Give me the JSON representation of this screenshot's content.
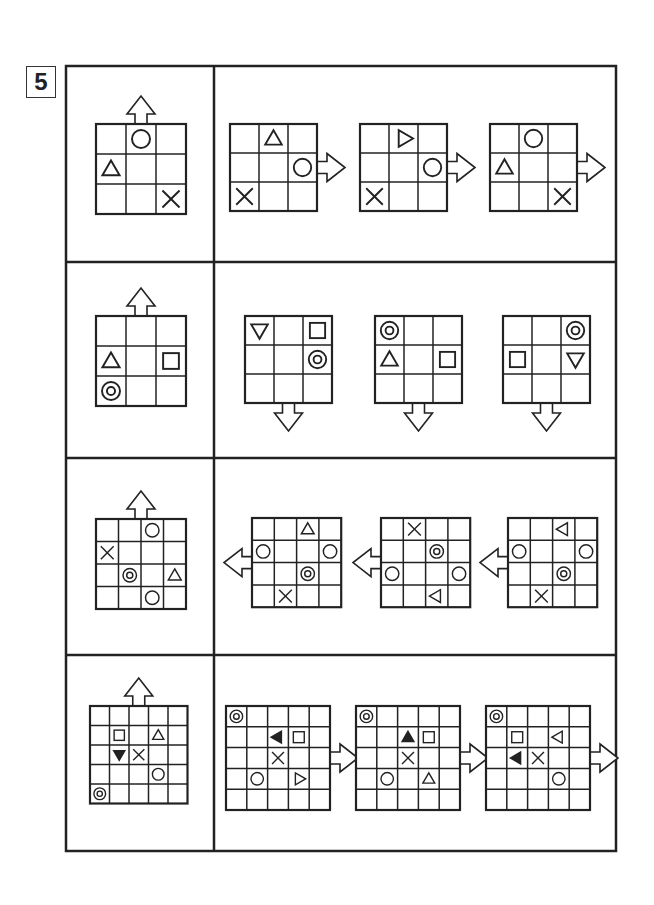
{
  "puzzle": {
    "number": "5",
    "colors": {
      "stroke": "#222222",
      "background": "#ffffff"
    },
    "rows": [
      {
        "reference": {
          "size": 3,
          "arrow": "up",
          "cells": [
            {
              "r": 0,
              "c": 1,
              "shape": "circle"
            },
            {
              "r": 1,
              "c": 0,
              "shape": "triangle-up"
            },
            {
              "r": 2,
              "c": 2,
              "shape": "cross"
            }
          ]
        },
        "options": [
          {
            "arrow": "right",
            "cells": [
              {
                "r": 0,
                "c": 1,
                "shape": "triangle-up"
              },
              {
                "r": 1,
                "c": 2,
                "shape": "circle"
              },
              {
                "r": 2,
                "c": 0,
                "shape": "cross"
              }
            ]
          },
          {
            "arrow": "right",
            "cells": [
              {
                "r": 0,
                "c": 1,
                "shape": "triangle-right"
              },
              {
                "r": 1,
                "c": 2,
                "shape": "circle"
              },
              {
                "r": 2,
                "c": 0,
                "shape": "cross"
              }
            ]
          },
          {
            "arrow": "right",
            "cells": [
              {
                "r": 0,
                "c": 1,
                "shape": "circle"
              },
              {
                "r": 1,
                "c": 0,
                "shape": "triangle-up"
              },
              {
                "r": 2,
                "c": 2,
                "shape": "cross"
              }
            ]
          }
        ]
      },
      {
        "reference": {
          "size": 3,
          "arrow": "up",
          "cells": [
            {
              "r": 1,
              "c": 0,
              "shape": "triangle-up"
            },
            {
              "r": 1,
              "c": 2,
              "shape": "square"
            },
            {
              "r": 2,
              "c": 0,
              "shape": "double-circle"
            }
          ]
        },
        "options": [
          {
            "arrow": "down",
            "cells": [
              {
                "r": 0,
                "c": 0,
                "shape": "triangle-down"
              },
              {
                "r": 0,
                "c": 2,
                "shape": "square"
              },
              {
                "r": 1,
                "c": 2,
                "shape": "double-circle"
              }
            ]
          },
          {
            "arrow": "down",
            "cells": [
              {
                "r": 0,
                "c": 0,
                "shape": "double-circle"
              },
              {
                "r": 1,
                "c": 0,
                "shape": "triangle-up"
              },
              {
                "r": 1,
                "c": 2,
                "shape": "square"
              }
            ]
          },
          {
            "arrow": "down",
            "cells": [
              {
                "r": 0,
                "c": 2,
                "shape": "double-circle"
              },
              {
                "r": 1,
                "c": 0,
                "shape": "square"
              },
              {
                "r": 1,
                "c": 2,
                "shape": "triangle-down"
              }
            ]
          }
        ]
      },
      {
        "reference": {
          "size": 4,
          "arrow": "up",
          "cells": [
            {
              "r": 0,
              "c": 2,
              "shape": "circle"
            },
            {
              "r": 1,
              "c": 0,
              "shape": "cross"
            },
            {
              "r": 2,
              "c": 1,
              "shape": "double-circle"
            },
            {
              "r": 2,
              "c": 3,
              "shape": "triangle-up"
            },
            {
              "r": 3,
              "c": 2,
              "shape": "circle"
            }
          ]
        },
        "options": [
          {
            "arrow": "left",
            "cells": [
              {
                "r": 0,
                "c": 2,
                "shape": "triangle-up"
              },
              {
                "r": 1,
                "c": 0,
                "shape": "circle"
              },
              {
                "r": 1,
                "c": 3,
                "shape": "circle"
              },
              {
                "r": 2,
                "c": 2,
                "shape": "double-circle"
              },
              {
                "r": 3,
                "c": 1,
                "shape": "cross"
              }
            ]
          },
          {
            "arrow": "left",
            "cells": [
              {
                "r": 0,
                "c": 1,
                "shape": "cross"
              },
              {
                "r": 1,
                "c": 2,
                "shape": "double-circle"
              },
              {
                "r": 2,
                "c": 0,
                "shape": "circle"
              },
              {
                "r": 2,
                "c": 3,
                "shape": "circle"
              },
              {
                "r": 3,
                "c": 2,
                "shape": "triangle-left"
              }
            ]
          },
          {
            "arrow": "left",
            "cells": [
              {
                "r": 0,
                "c": 2,
                "shape": "triangle-left"
              },
              {
                "r": 1,
                "c": 0,
                "shape": "circle"
              },
              {
                "r": 1,
                "c": 3,
                "shape": "circle"
              },
              {
                "r": 2,
                "c": 2,
                "shape": "double-circle"
              },
              {
                "r": 3,
                "c": 1,
                "shape": "cross"
              }
            ]
          }
        ]
      },
      {
        "reference": {
          "size": 5,
          "arrow": "up",
          "cells": [
            {
              "r": 1,
              "c": 1,
              "shape": "square"
            },
            {
              "r": 1,
              "c": 3,
              "shape": "triangle-up"
            },
            {
              "r": 2,
              "c": 1,
              "shape": "filled-triangle-down"
            },
            {
              "r": 2,
              "c": 2,
              "shape": "cross"
            },
            {
              "r": 3,
              "c": 3,
              "shape": "circle"
            },
            {
              "r": 4,
              "c": 0,
              "shape": "double-circle"
            }
          ]
        },
        "options": [
          {
            "arrow": "right",
            "cells": [
              {
                "r": 0,
                "c": 0,
                "shape": "double-circle"
              },
              {
                "r": 1,
                "c": 2,
                "shape": "filled-triangle-left"
              },
              {
                "r": 1,
                "c": 3,
                "shape": "square"
              },
              {
                "r": 2,
                "c": 2,
                "shape": "cross"
              },
              {
                "r": 3,
                "c": 1,
                "shape": "circle"
              },
              {
                "r": 3,
                "c": 3,
                "shape": "triangle-right"
              }
            ]
          },
          {
            "arrow": "right",
            "cells": [
              {
                "r": 0,
                "c": 0,
                "shape": "double-circle"
              },
              {
                "r": 1,
                "c": 2,
                "shape": "filled-triangle-up"
              },
              {
                "r": 1,
                "c": 3,
                "shape": "square"
              },
              {
                "r": 2,
                "c": 2,
                "shape": "cross"
              },
              {
                "r": 3,
                "c": 1,
                "shape": "circle"
              },
              {
                "r": 3,
                "c": 3,
                "shape": "triangle-up"
              }
            ]
          },
          {
            "arrow": "right",
            "cells": [
              {
                "r": 0,
                "c": 0,
                "shape": "double-circle"
              },
              {
                "r": 1,
                "c": 1,
                "shape": "square"
              },
              {
                "r": 1,
                "c": 3,
                "shape": "triangle-left"
              },
              {
                "r": 2,
                "c": 1,
                "shape": "filled-triangle-left"
              },
              {
                "r": 2,
                "c": 2,
                "shape": "cross"
              },
              {
                "r": 3,
                "c": 3,
                "shape": "circle"
              }
            ]
          }
        ]
      }
    ]
  }
}
